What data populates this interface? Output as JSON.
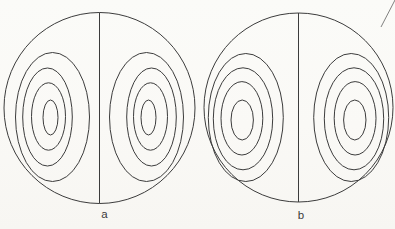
{
  "figure": {
    "background_color": "#fbfaf7",
    "stroke_color": "#3c3c3c",
    "label_color": "#3a3a3a",
    "label_font_size": 11.5,
    "panels": [
      {
        "label": "a",
        "label_pos": {
          "x": 104.5,
          "y": 218
        },
        "circle": {
          "cx": 99.5,
          "cy": 108,
          "r": 95.5
        },
        "diameter_line": {
          "x": 99.5,
          "y1": 12.5,
          "y2": 203.5
        },
        "contours_left": [
          {
            "cx": 52.5,
            "cy": 117.0,
            "rx": 37.0,
            "ry": 64.5
          },
          {
            "cx": 47.5,
            "cy": 117.0,
            "rx": 24.8,
            "ry": 49.0
          },
          {
            "cx": 48.5,
            "cy": 116.5,
            "rx": 17.0,
            "ry": 33.7
          },
          {
            "cx": 50.5,
            "cy": 117.5,
            "rx": 7.5,
            "ry": 17.5
          }
        ]
      },
      {
        "label": "b",
        "label_pos": {
          "x": 301,
          "y": 218.5
        },
        "circle": {
          "cx": 298.5,
          "cy": 107.5,
          "r": 94.5
        },
        "diameter_line": {
          "x": 298.5,
          "y1": 13,
          "y2": 202
        },
        "contours_left": [
          {
            "cx": 245.8,
            "cy": 117.5,
            "rx": 37.5,
            "ry": 64.0
          },
          {
            "cx": 243.0,
            "cy": 118.8,
            "rx": 29.7,
            "ry": 51.0
          },
          {
            "cx": 241.9,
            "cy": 118.3,
            "rx": 20.9,
            "ry": 36.7
          },
          {
            "cx": 242.2,
            "cy": 120.0,
            "rx": 11.2,
            "ry": 20.0
          }
        ]
      }
    ],
    "scan_artifact": {
      "x1": 381,
      "y1": 27,
      "x2": 395,
      "y2": 0
    }
  }
}
